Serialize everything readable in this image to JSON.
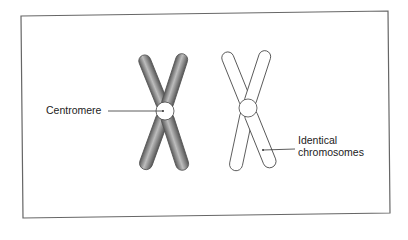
{
  "figure": {
    "labels": {
      "centromere": "Centromere",
      "identical_line1": "Identical",
      "identical_line2": "chromosomes"
    },
    "colors": {
      "frame": "#555555",
      "shaded_chromosome": "#7a7a7a",
      "outline": "#444444"
    }
  }
}
